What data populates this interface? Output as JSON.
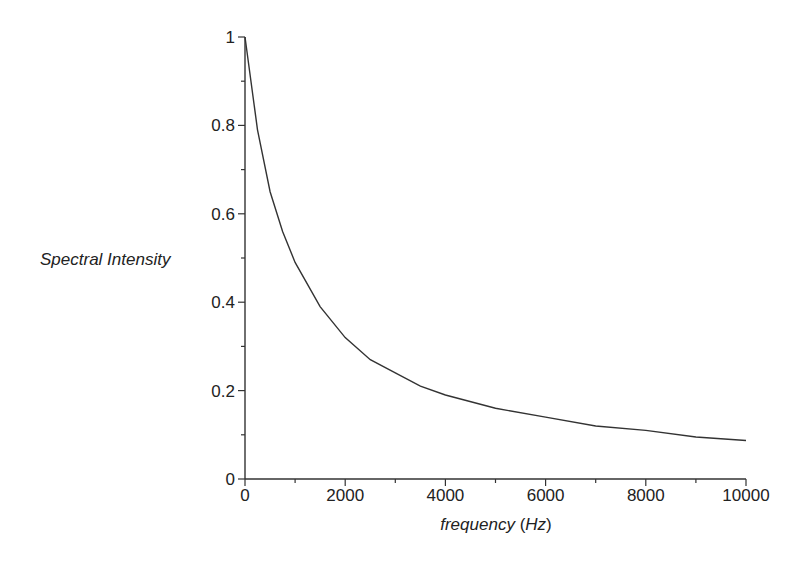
{
  "chart_data": {
    "type": "line",
    "title": "",
    "xlabel": "frequency (Hz)",
    "xlabel_parts": {
      "main": "frequency",
      "unit": "Hz"
    },
    "ylabel": "Spectral Intensity",
    "xlim": [
      0,
      10000
    ],
    "ylim": [
      0,
      1
    ],
    "grid": false,
    "legend": null,
    "x_ticks": [
      0,
      2000,
      4000,
      6000,
      8000,
      10000
    ],
    "x_tick_labels": [
      "0",
      "2000",
      "4000",
      "6000",
      "8000",
      "10000"
    ],
    "x_minor_ticks": [
      1000,
      3000,
      5000,
      7000,
      9000
    ],
    "y_ticks": [
      0,
      0.2,
      0.4,
      0.6,
      0.8,
      1
    ],
    "y_tick_labels": [
      "0",
      "0.2",
      "0.4",
      "0.6",
      "0.8",
      "1"
    ],
    "y_minor_ticks": [
      0.1,
      0.3,
      0.5,
      0.7,
      0.9
    ],
    "series": [
      {
        "name": "Spectral Intensity",
        "color": "#333333",
        "x": [
          0,
          250,
          500,
          750,
          1000,
          1500,
          2000,
          2500,
          3000,
          3500,
          4000,
          5000,
          6000,
          7000,
          8000,
          9000,
          10000
        ],
        "values": [
          1.0,
          0.79,
          0.65,
          0.56,
          0.49,
          0.39,
          0.32,
          0.27,
          0.24,
          0.21,
          0.19,
          0.16,
          0.14,
          0.12,
          0.11,
          0.095,
          0.087
        ]
      }
    ]
  }
}
